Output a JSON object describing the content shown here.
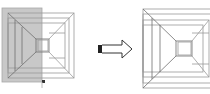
{
  "figure": {
    "colors": {
      "background": "#ffffff",
      "line": "#9a9a9a",
      "line_dark": "#6e6e6e",
      "selection_fill": "#c8c8c8",
      "selection_stroke": "#a8a8a8",
      "grip": "#333333",
      "arrow_stroke": "#333333",
      "arrow_tail": "#222222"
    },
    "before": {
      "label": "before-drawing",
      "selection_window": {
        "x": 2,
        "y": 8,
        "w": 40,
        "h": 74
      },
      "grip": {
        "x": 42,
        "y": 80,
        "size": 3
      }
    },
    "arrow": {
      "label": "result-arrow",
      "direction": "right"
    },
    "after": {
      "label": "after-drawing"
    }
  }
}
